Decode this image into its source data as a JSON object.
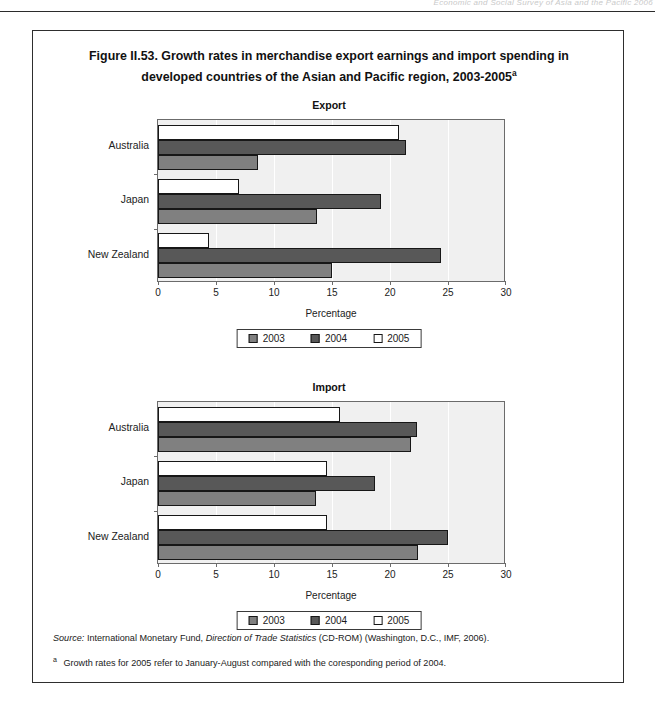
{
  "page_header": {
    "running_text": "Economic and Social Survey of Asia and the Pacific 2006"
  },
  "figure": {
    "title_line1": "Figure II.53.  Growth rates in merchandise export earnings and import spending in",
    "title_line2": "developed countries of the Asian and Pacific region, 2003-2005",
    "title_superscript": "a"
  },
  "legend": {
    "items": [
      {
        "label": "2003",
        "swatch": "y2003",
        "color": "#808080"
      },
      {
        "label": "2004",
        "swatch": "y2004",
        "color": "#585858"
      },
      {
        "label": "2005",
        "swatch": "y2005",
        "color": "#ffffff"
      }
    ]
  },
  "axis": {
    "caption": "Percentage",
    "ticks": [
      "0",
      "5",
      "10",
      "15",
      "20",
      "25",
      "30"
    ]
  },
  "notes": {
    "source_label": "Source:",
    "source_text_a": "International Monetary Fund,",
    "source_italic": "Direction of Trade Statistics",
    "source_text_b": "(CD-ROM) (Washington, D.C., IMF, 2006).",
    "footnote_marker": "a",
    "footnote_text": "Growth rates for 2005 refer to January-August compared with the coresponding period of 2004."
  },
  "chart_data": [
    {
      "type": "bar",
      "orientation": "horizontal",
      "title": "Export",
      "xlabel": "Percentage",
      "ylabel": "",
      "xlim": [
        0,
        30
      ],
      "xticks": [
        0,
        5,
        10,
        15,
        20,
        25,
        30
      ],
      "grid": "vertical-white",
      "legend_position": "bottom-center",
      "categories": [
        "Australia",
        "Japan",
        "New Zealand"
      ],
      "series": [
        {
          "name": "2003",
          "color": "#808080",
          "values": [
            8.6,
            13.7,
            15.0
          ]
        },
        {
          "name": "2004",
          "color": "#585858",
          "values": [
            21.4,
            19.2,
            24.4
          ]
        },
        {
          "name": "2005",
          "color": "#ffffff",
          "values": [
            20.8,
            7.0,
            4.4
          ]
        }
      ]
    },
    {
      "type": "bar",
      "orientation": "horizontal",
      "title": "Import",
      "xlabel": "Percentage",
      "ylabel": "",
      "xlim": [
        0,
        30
      ],
      "xticks": [
        0,
        5,
        10,
        15,
        20,
        25,
        30
      ],
      "grid": "vertical-white",
      "legend_position": "bottom-center",
      "categories": [
        "Australia",
        "Japan",
        "New Zealand"
      ],
      "series": [
        {
          "name": "2003",
          "color": "#808080",
          "values": [
            21.8,
            13.6,
            22.4
          ]
        },
        {
          "name": "2004",
          "color": "#585858",
          "values": [
            22.3,
            18.7,
            25.0
          ]
        },
        {
          "name": "2005",
          "color": "#ffffff",
          "values": [
            15.7,
            14.6,
            14.6
          ]
        }
      ]
    }
  ]
}
